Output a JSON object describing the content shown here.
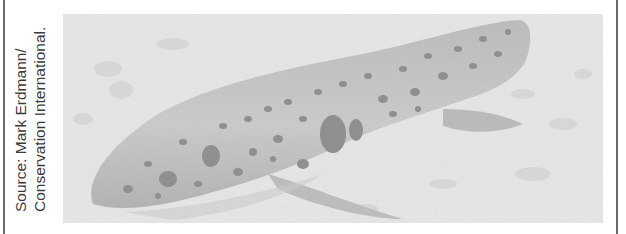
{
  "figure": {
    "caption_lines": [
      "Source: Mark Erdmann/",
      "Conservation International."
    ],
    "image_subject": "epaulette-style spotted shark resting on sandy seafloor",
    "colors": {
      "frame": "#6a6a6a",
      "caption_text": "#3a3a3a",
      "sand": "#d8d8d6",
      "shark_body": "#9a9a98",
      "spots": "#3a3a3a"
    }
  }
}
